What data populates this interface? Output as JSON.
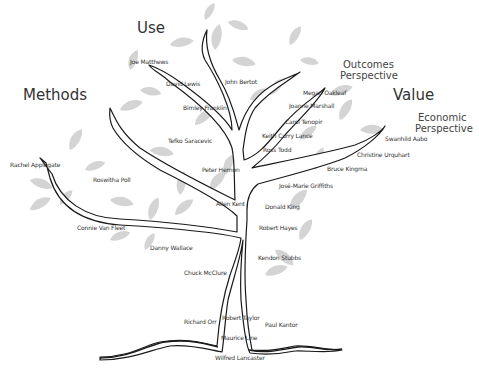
{
  "categories": {
    "use": "Use",
    "methods": "Methods",
    "value": "Value",
    "outcomes_line1": "Outcomes",
    "outcomes_line2": "Perspective",
    "economic_line1": "Economic",
    "economic_line2": "Perspective"
  },
  "names": [
    {
      "label": "Joe Matthews",
      "x": 130,
      "y": 58
    },
    {
      "label": "David Lewis",
      "x": 166,
      "y": 80
    },
    {
      "label": "John Bertot",
      "x": 225,
      "y": 78
    },
    {
      "label": "Bimley Franklin",
      "x": 183,
      "y": 104
    },
    {
      "label": "Tefko Saracevic",
      "x": 168,
      "y": 137
    },
    {
      "label": "Megan Oakleaf",
      "x": 303,
      "y": 89
    },
    {
      "label": "Joanne Marshall",
      "x": 289,
      "y": 102
    },
    {
      "label": "Carol Tenopir",
      "x": 285,
      "y": 118
    },
    {
      "label": "Keith Curry Lance",
      "x": 262,
      "y": 132
    },
    {
      "label": "Ross Todd",
      "x": 263,
      "y": 146
    },
    {
      "label": "Swanhild Aabo",
      "x": 385,
      "y": 135
    },
    {
      "label": "Christine Urquhart",
      "x": 357,
      "y": 151
    },
    {
      "label": "Bruce Kingma",
      "x": 327,
      "y": 165
    },
    {
      "label": "Rachel Applegate",
      "x": 10,
      "y": 161
    },
    {
      "label": "Roswitha Poll",
      "x": 93,
      "y": 176
    },
    {
      "label": "Peter Hernon",
      "x": 202,
      "y": 166
    },
    {
      "label": "José-Marie Griffiths",
      "x": 279,
      "y": 182
    },
    {
      "label": "Allen Kent",
      "x": 216,
      "y": 200
    },
    {
      "label": "Donald King",
      "x": 265,
      "y": 203
    },
    {
      "label": "Connie Van Fleet",
      "x": 77,
      "y": 224
    },
    {
      "label": "Robert Hayes",
      "x": 259,
      "y": 224
    },
    {
      "label": "Danny Wallace",
      "x": 150,
      "y": 244
    },
    {
      "label": "Kendon Stubbs",
      "x": 258,
      "y": 254
    },
    {
      "label": "Chuck McClure",
      "x": 184,
      "y": 269
    },
    {
      "label": "Robert Taylor",
      "x": 222,
      "y": 314
    },
    {
      "label": "Richard Orr",
      "x": 184,
      "y": 318
    },
    {
      "label": "Paul Kantor",
      "x": 265,
      "y": 321
    },
    {
      "label": "Maurice Line",
      "x": 221,
      "y": 334
    },
    {
      "label": "Wilfred Lancaster",
      "x": 215,
      "y": 354
    }
  ],
  "colors": {
    "leaf": "#d3d3d3",
    "outline": "#1a1a1a",
    "text": "#333333"
  }
}
